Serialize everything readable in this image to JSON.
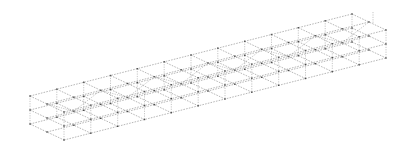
{
  "diagram": {
    "type": "3d-wireframe-beam-mesh",
    "background": "#ffffff",
    "line_color": "#7a7a7a",
    "node_color": "#4a4a4a",
    "origin": [
      30,
      96
    ],
    "length_vector": [
      322,
      -82
    ],
    "width_vector": [
      34,
      16
    ],
    "layer_offset": [
      0,
      14
    ],
    "layers": [
      {
        "name": "top",
        "index": 0
      },
      {
        "name": "middle",
        "index": 1
      },
      {
        "name": "bottom",
        "index": 2
      }
    ],
    "divisions_length": 12,
    "divisions_width": 2,
    "vertical_ties": true
  }
}
